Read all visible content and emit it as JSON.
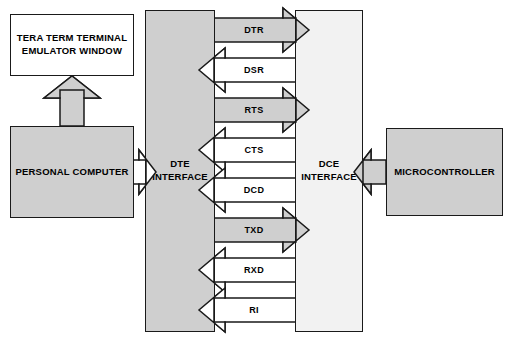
{
  "diagram": {
    "colors": {
      "gray_fill": "#cfcfcf",
      "pale_fill": "#f2f2f2",
      "white_fill": "#ffffff",
      "stroke": "#1a1a1a"
    },
    "blocks": [
      {
        "id": "terminal",
        "label": "TERA TERM TERMINAL\nEMULATOR WINDOW",
        "fill": "white"
      },
      {
        "id": "personal_computer",
        "label": "PERSONAL COMPUTER",
        "fill": "gray"
      },
      {
        "id": "dte_interface",
        "label": "DTE\nINTERFACE",
        "fill": "gray"
      },
      {
        "id": "dce_interface",
        "label": "DCE\nINTERFACE",
        "fill": "pale"
      },
      {
        "id": "microcontroller",
        "label": "MICROCONTROLLER",
        "fill": "gray"
      }
    ],
    "signals": [
      {
        "name": "DTR",
        "direction": "dte-to-dce",
        "fill": "gray"
      },
      {
        "name": "DSR",
        "direction": "dce-to-dte",
        "fill": "white"
      },
      {
        "name": "RTS",
        "direction": "dte-to-dce",
        "fill": "gray"
      },
      {
        "name": "CTS",
        "direction": "dce-to-dte",
        "fill": "white"
      },
      {
        "name": "DCD",
        "direction": "dce-to-dte",
        "fill": "white"
      },
      {
        "name": "TXD",
        "direction": "dte-to-dce",
        "fill": "gray"
      },
      {
        "name": "RXD",
        "direction": "dce-to-dte",
        "fill": "white"
      },
      {
        "name": "RI",
        "direction": "dce-to-dte",
        "fill": "white"
      }
    ],
    "connectors": [
      {
        "id": "pc-to-terminal",
        "direction": "up",
        "fill": "gray"
      },
      {
        "id": "pc-to-dte",
        "direction": "right",
        "fill": "white"
      },
      {
        "id": "mcu-to-dce",
        "direction": "left",
        "fill": "gray"
      }
    ]
  }
}
